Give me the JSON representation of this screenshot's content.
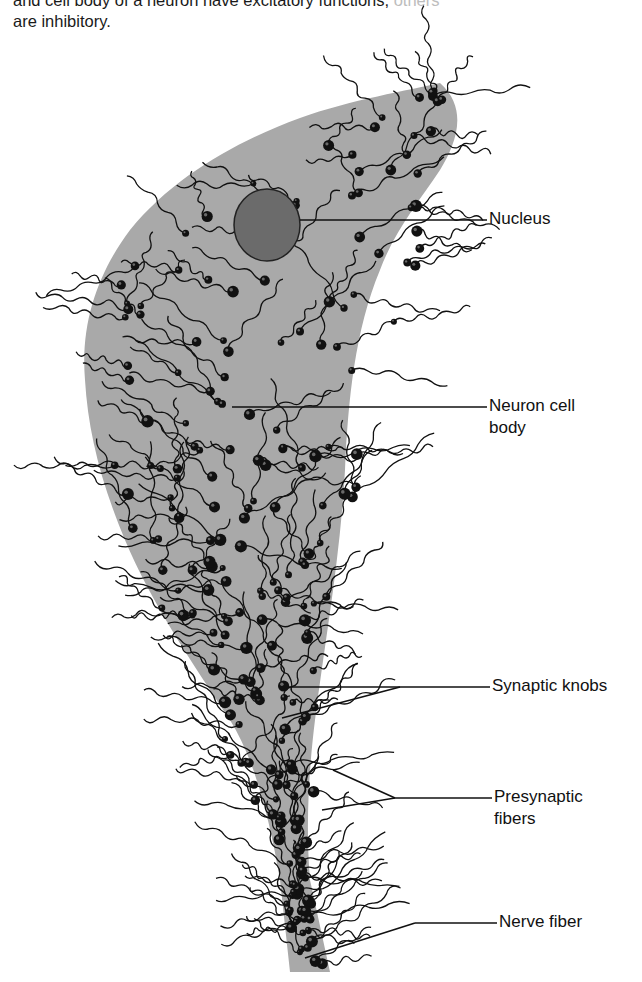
{
  "caption": {
    "line1_visible": "and cell body of a neuron have excitatory functions;",
    "line1_faded": " others",
    "line2": "are inhibitory."
  },
  "figure": {
    "colors": {
      "cell_body": "#a9a9a9",
      "knob": "#111111",
      "fiber": "#111111",
      "nucleus_fill": "#6b6b6b",
      "leader": "#111111"
    },
    "labels": {
      "nucleus": "Nucleus",
      "cell_body_line1": "Neuron cell",
      "cell_body_line2": "body",
      "synaptic_knobs": "Synaptic knobs",
      "presynaptic_line1": "Presynaptic",
      "presynaptic_line2": "fibers",
      "nerve_fiber": "Nerve fiber"
    }
  }
}
